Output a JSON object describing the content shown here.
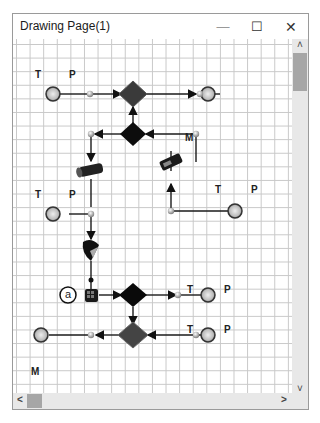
{
  "window": {
    "title": "Drawing Page(1)",
    "controls": {
      "minimize": "—",
      "maximize": "☐",
      "close": "✕"
    }
  },
  "scrollbars": {
    "up_arrow": "˄",
    "down_arrow": "˅",
    "left_arrow": "<",
    "right_arrow": ">"
  },
  "diagram": {
    "labels": [
      {
        "id": "t1",
        "text": "T",
        "x": 22,
        "y": 30
      },
      {
        "id": "p1",
        "text": "P",
        "x": 56,
        "y": 30
      },
      {
        "id": "m1",
        "text": "M",
        "x": 172,
        "y": 93
      },
      {
        "id": "t2",
        "text": "T",
        "x": 22,
        "y": 150
      },
      {
        "id": "p2",
        "text": "P",
        "x": 56,
        "y": 150
      },
      {
        "id": "t3",
        "text": "T",
        "x": 202,
        "y": 145
      },
      {
        "id": "p3",
        "text": "P",
        "x": 238,
        "y": 145
      },
      {
        "id": "t4",
        "text": "T",
        "x": 174,
        "y": 245
      },
      {
        "id": "p4",
        "text": "P",
        "x": 211,
        "y": 245
      },
      {
        "id": "t5",
        "text": "T",
        "x": 174,
        "y": 285
      },
      {
        "id": "p5",
        "text": "P",
        "x": 211,
        "y": 285
      },
      {
        "id": "m2",
        "text": "M",
        "x": 18,
        "y": 327
      }
    ],
    "node_annotation": "a",
    "components": [
      "stream-source-top-left",
      "stream-sink-top-right",
      "mixer-top",
      "splitter-top",
      "pipe-left",
      "compressor-right",
      "stream-source-mid-left",
      "stream-source-mid-right",
      "valve-left",
      "heat-exchanger-block",
      "splitter-bottom",
      "mixer-bottom",
      "stream-sink-bottom-right-1",
      "stream-source-bottom-right-2",
      "stream-sink-bottom-left"
    ]
  },
  "colors": {
    "grid": "#c8c8c8",
    "scroll_track": "#e8e8e8",
    "scroll_thumb": "#a6a6a6",
    "line": "#1a1a1a"
  }
}
